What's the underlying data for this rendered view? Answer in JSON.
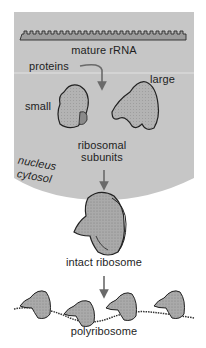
{
  "diagram": {
    "colors": {
      "nucleus_fill": "#c6c6c6",
      "ribosome_fill": "#a9a9a9",
      "ribosome_outline": "#222222",
      "arrow": "#6a6a6a",
      "background": "#ffffff",
      "divider": "#e2e2e2"
    },
    "labels": {
      "mature_rrna": "mature rRNA",
      "proteins": "proteins",
      "large": "large",
      "small": "small",
      "ribosomal": "ribosomal",
      "subunits": "subunits",
      "nucleus": "nucleus",
      "cytosol": "cytosol",
      "intact_ribosome": "intact ribosome",
      "polyribosome": "polyribosome"
    },
    "compartments": [
      "nucleus",
      "cytosol"
    ],
    "stages": [
      "mature rRNA",
      "ribosomal subunits (small, large)",
      "intact ribosome",
      "polyribosome"
    ]
  }
}
